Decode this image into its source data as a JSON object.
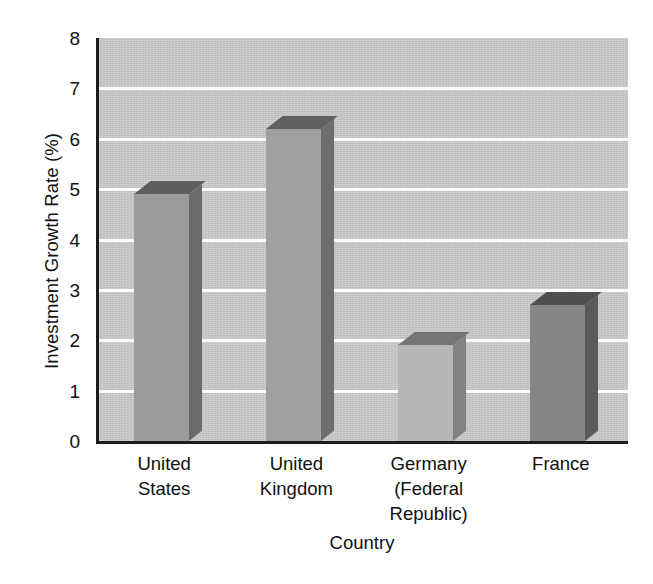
{
  "chart_data": {
    "type": "bar",
    "title": "",
    "subtitle": "",
    "xlabel": "Country",
    "ylabel": "Investment Growth Rate (%)",
    "categories": [
      "United States",
      "United Kingdom",
      "Germany (Federal Republic)",
      "France"
    ],
    "category_lines": [
      [
        "United",
        "States"
      ],
      [
        "United",
        "Kingdom"
      ],
      [
        "Germany",
        "(Federal",
        "Republic)"
      ],
      [
        "France"
      ]
    ],
    "values": [
      4.9,
      6.2,
      1.9,
      2.7
    ],
    "ylim": [
      0,
      8
    ],
    "ytick_labels": [
      "0",
      "1",
      "2",
      "3",
      "4",
      "5",
      "6",
      "7",
      "8"
    ],
    "ytick_values": [
      0,
      1,
      2,
      3,
      4,
      5,
      6,
      7,
      8
    ],
    "grid": true,
    "grid_axis": "y",
    "gridline_color": "#fbfbfb",
    "legend": false,
    "legend_position": "none",
    "style": "3d-bar",
    "plot_background": "#cbcbcb",
    "axis_color": "#1d1d1d",
    "bar_colors": [
      "#9c9c9c",
      "#a0a0a0",
      "#b6b6b6",
      "#868686"
    ],
    "bar_side_colors": [
      "#6a6a6a",
      "#6d6d6d",
      "#828282",
      "#5a5a5a"
    ],
    "bar_top_colors": [
      "#5e5e5e",
      "#606060",
      "#757575",
      "#4f4f4f"
    ]
  }
}
